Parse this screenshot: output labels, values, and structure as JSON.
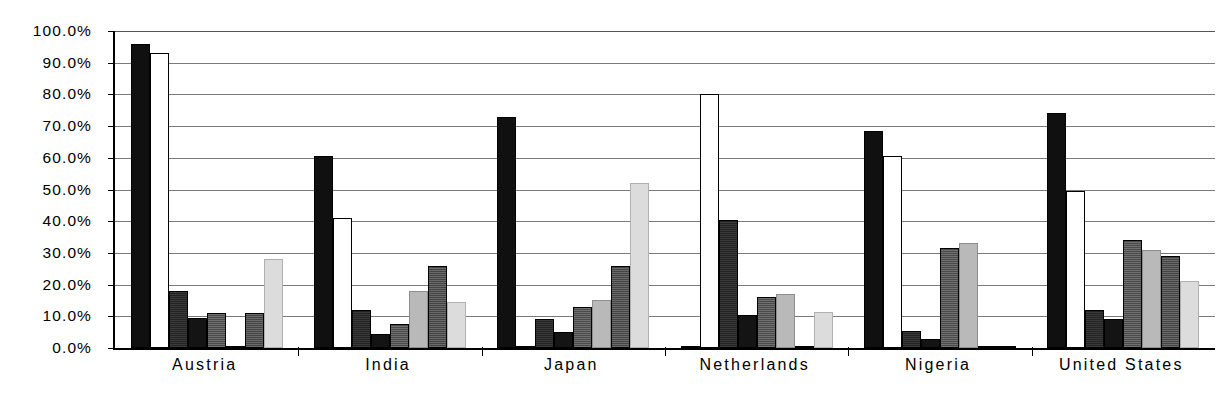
{
  "chart_data": {
    "type": "bar",
    "title": "",
    "subtitle": "",
    "xlabel": "",
    "ylabel": "",
    "ylim": [
      0,
      100
    ],
    "grid": true,
    "legend_position": "none",
    "categories": [
      "Austria",
      "India",
      "Japan",
      "Netherlands",
      "Nigeria",
      "United States"
    ],
    "tick_labels_y": [
      "100.0%",
      "90.0%",
      "80.0%",
      "70.0%",
      "60.0%",
      "50.0%",
      "40.0%",
      "30.0%",
      "20.0%",
      "10.0%",
      "0.0%"
    ],
    "tick_values_y": [
      100,
      90,
      80,
      70,
      60,
      50,
      40,
      30,
      20,
      10,
      0
    ],
    "units": "percent",
    "series": [
      {
        "name": "Series 1",
        "style": "solid-black",
        "values": [
          96.0,
          60.5,
          73.0,
          0.0,
          68.5,
          74.0
        ]
      },
      {
        "name": "Series 2",
        "style": "white-outline",
        "values": [
          93.0,
          41.0,
          0.0,
          80.0,
          60.5,
          49.5
        ]
      },
      {
        "name": "Series 3",
        "style": "dark-stipple",
        "values": [
          18.0,
          12.0,
          9.0,
          40.5,
          5.5,
          12.0
        ]
      },
      {
        "name": "Series 4",
        "style": "solid-black-2",
        "values": [
          9.5,
          4.5,
          5.0,
          10.5,
          3.0,
          9.0
        ]
      },
      {
        "name": "Series 5",
        "style": "medium-dark-stipple",
        "values": [
          11.0,
          7.5,
          13.0,
          16.0,
          31.5,
          34.0
        ]
      },
      {
        "name": "Series 6",
        "style": "light-gray",
        "values": [
          0.0,
          18.0,
          15.0,
          17.0,
          33.0,
          31.0
        ]
      },
      {
        "name": "Series 7",
        "style": "dark-stipple-bold",
        "values": [
          11.0,
          26.0,
          26.0,
          0.0,
          0.0,
          29.0
        ]
      },
      {
        "name": "Series 8",
        "style": "very-light-gray",
        "values": [
          28.0,
          14.5,
          52.0,
          11.5,
          0.0,
          21.0
        ]
      }
    ]
  }
}
